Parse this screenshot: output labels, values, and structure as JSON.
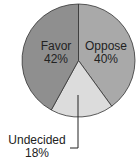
{
  "chart_data": {
    "type": "pie",
    "title": "",
    "start_angle_deg": 0,
    "direction": "clockwise",
    "slices": [
      {
        "label": "Oppose",
        "value": 40,
        "display": "40%",
        "color": "#a9a9a9"
      },
      {
        "label": "Undecided",
        "value": 18,
        "display": "18%",
        "color": "#dcdcdc"
      },
      {
        "label": "Favor",
        "value": 42,
        "display": "42%",
        "color": "#8f8f8f"
      }
    ]
  },
  "labels": {
    "favor": {
      "name": "Favor",
      "pct": "42%"
    },
    "oppose": {
      "name": "Oppose",
      "pct": "40%"
    },
    "undecided": {
      "name": "Undecided",
      "pct": "18%"
    }
  }
}
